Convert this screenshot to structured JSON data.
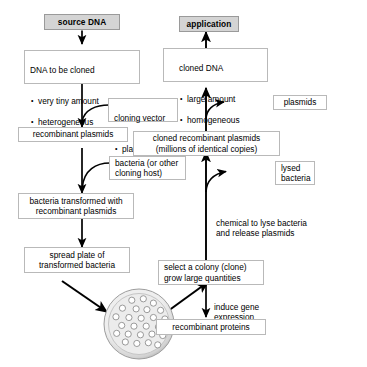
{
  "diagram": {
    "colors": {
      "shaded_box_fill": "#d4d4d4",
      "box_border": "#b9b9b9",
      "arrow": "#000000",
      "dish_rim": "#c8c8c8",
      "colony_fill": "#ffffff"
    },
    "nodes": {
      "source_dna": {
        "label": "source DNA"
      },
      "dna_to_be_cloned": {
        "title": "DNA to be cloned",
        "bullets": [
          "very tiny amount",
          "heterogeneous"
        ]
      },
      "cloning_vector": {
        "title": "cloning vector",
        "bullets": [
          "plasmids"
        ]
      },
      "recombinant_plasmids": {
        "label": "recombinant plasmids"
      },
      "bacteria_host": {
        "label": "bacteria (or other\ncloning host)"
      },
      "bacteria_transformed": {
        "label": "bacteria transformed with\nrecombinant plasmids"
      },
      "spread_plate": {
        "label": "spread plate of\ntransformed bacteria"
      },
      "select_colony": {
        "label": "select a colony (clone)\ngrow large quantities"
      },
      "induce_gene_expression": {
        "label": "induce gene\nexpression"
      },
      "recombinant_proteins": {
        "label": "recombinant proteins"
      },
      "chemical_lyse": {
        "label": "chemical to lyse bacteria\nand release plasmids"
      },
      "lysed_bacteria": {
        "label": "lysed\nbacteria"
      },
      "cloned_recombinant_plasmids": {
        "label": "cloned recombinant plasmids\n(millions of identical copies)"
      },
      "plasmids": {
        "label": "plasmids"
      },
      "cloned_dna": {
        "title": "cloned DNA",
        "bullets": [
          "large amount",
          "homogeneous"
        ]
      },
      "application": {
        "label": "application"
      }
    },
    "petri_dish": {
      "name": "petri-dish",
      "colony_count": 26,
      "colonies": [
        [
          0.4,
          0.17
        ],
        [
          0.56,
          0.15
        ],
        [
          0.7,
          0.21
        ],
        [
          0.27,
          0.28
        ],
        [
          0.46,
          0.29
        ],
        [
          0.61,
          0.3
        ],
        [
          0.8,
          0.31
        ],
        [
          0.18,
          0.4
        ],
        [
          0.36,
          0.41
        ],
        [
          0.53,
          0.42
        ],
        [
          0.7,
          0.41
        ],
        [
          0.86,
          0.43
        ],
        [
          0.26,
          0.52
        ],
        [
          0.43,
          0.53
        ],
        [
          0.6,
          0.53
        ],
        [
          0.77,
          0.54
        ],
        [
          0.9,
          0.55
        ],
        [
          0.19,
          0.63
        ],
        [
          0.35,
          0.64
        ],
        [
          0.52,
          0.65
        ],
        [
          0.68,
          0.64
        ],
        [
          0.83,
          0.66
        ],
        [
          0.31,
          0.75
        ],
        [
          0.47,
          0.77
        ],
        [
          0.63,
          0.76
        ],
        [
          0.76,
          0.79
        ]
      ]
    }
  }
}
